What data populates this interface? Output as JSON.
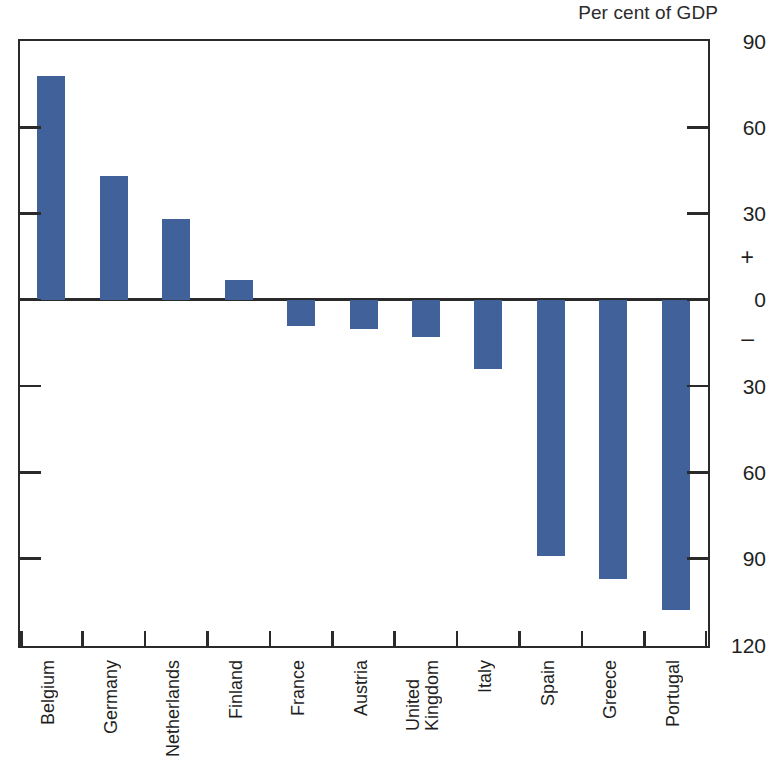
{
  "chart_data": {
    "type": "bar",
    "title": "",
    "subtitle": "",
    "unit_caption": "Per cent of GDP",
    "xlabel": "",
    "ylabel": "Per cent of GDP",
    "ylim": [
      -120,
      90
    ],
    "grid": false,
    "legend": null,
    "orientation": "vertical",
    "bar_color": "#41619b",
    "axis_color": "#2a2a2a",
    "zero_line": 0,
    "y_ticks": [
      90,
      60,
      30,
      0,
      -30,
      -60,
      -90,
      -120
    ],
    "y_tick_labels": [
      "90",
      "60",
      "30",
      "0",
      "30",
      "60",
      "90",
      "120"
    ],
    "y_sign_markers": [
      {
        "symbol": "+",
        "value": 15
      },
      {
        "symbol": "–",
        "value": -13
      }
    ],
    "categories": [
      "Belgium",
      "Germany",
      "Netherlands",
      "Finland",
      "France",
      "Austria",
      "United\nKingdom",
      "Italy",
      "Spain",
      "Greece",
      "Portugal"
    ],
    "values": [
      78,
      43,
      28,
      7,
      -9,
      -10,
      -13,
      -24,
      -89,
      -97,
      -108
    ]
  },
  "axis": {
    "right_labels": [
      {
        "text": "90",
        "value": 90
      },
      {
        "text": "60",
        "value": 60
      },
      {
        "text": "30",
        "value": 30
      },
      {
        "text": "0",
        "value": 0
      },
      {
        "text": "30",
        "value": -30
      },
      {
        "text": "60",
        "value": -60
      },
      {
        "text": "90",
        "value": -90
      },
      {
        "text": "120",
        "value": -120
      }
    ],
    "plus_sign": "+",
    "minus_sign": "–"
  }
}
